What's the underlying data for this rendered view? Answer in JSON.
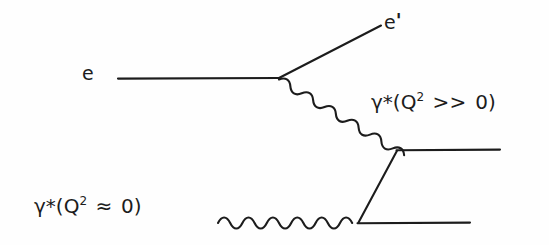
{
  "figure": {
    "kind": "feynman-diagram",
    "background_color": "#fefefe",
    "stroke_color": "#1c1c1c"
  },
  "labels": {
    "incoming_electron": "e",
    "scattered_electron_base": "e",
    "scattered_electron_prime": "'",
    "virtual_photon_high": {
      "gamma": "γ",
      "star": "*",
      "open_paren": "(",
      "q": "Q",
      "exponent": "2",
      "relation": ">>",
      "value": "0",
      "close_paren": ")",
      "full_text": "γ*(Q² >> 0)"
    },
    "virtual_photon_low": {
      "gamma": "γ",
      "star": "*",
      "open_paren": "(",
      "q": "Q",
      "exponent": "2",
      "relation": "≈",
      "value": "0",
      "close_paren": ")",
      "full_text": "γ*(Q² ≈ 0)"
    }
  },
  "geometry": {
    "incoming_electron_line": {
      "x1": 118,
      "y1": 78,
      "x2": 279,
      "y2": 78
    },
    "scattered_electron_line": {
      "x1": 279,
      "y1": 78,
      "x2": 381,
      "y2": 26
    },
    "virtual_photon_wavy_diagonal": {
      "x1": 279,
      "y1": 80,
      "x2": 396,
      "y2": 151
    },
    "photon_wavy_horizontal": {
      "x1": 218,
      "y1": 223,
      "x2": 357,
      "y2": 223
    },
    "hadron_line_upper": {
      "x1": 397,
      "y1": 150,
      "x2": 500,
      "y2": 150
    },
    "hadron_line_lower": {
      "x1": 357,
      "y1": 223,
      "x2": 470,
      "y2": 223
    },
    "hadron_line_diagonal": {
      "x1": 397,
      "y1": 151,
      "x2": 358,
      "y2": 223
    }
  }
}
